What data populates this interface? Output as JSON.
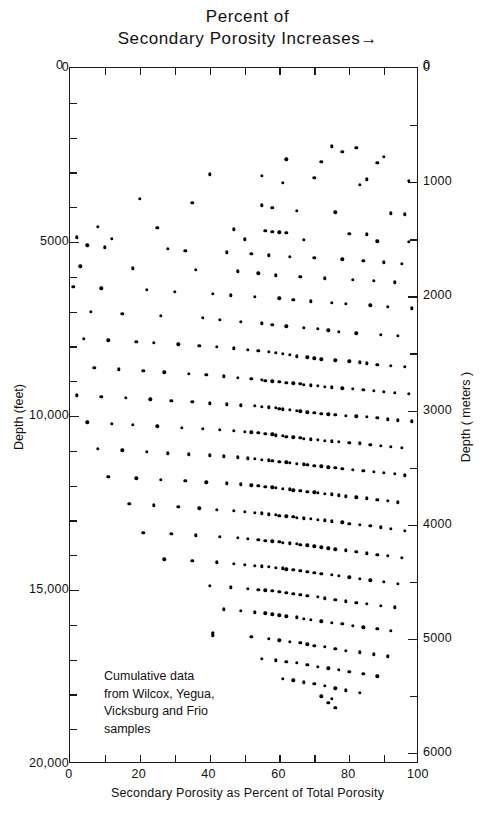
{
  "title": {
    "line1": "Percent of",
    "line2": "Secondary Porosity Increases",
    "arrow": "→"
  },
  "axes": {
    "x": {
      "title": "Secondary Porosity as Percent of Total Porosity",
      "min": 0,
      "max": 100,
      "major_ticks": [
        0,
        20,
        40,
        60,
        80,
        100
      ],
      "minor_ticks": [
        10,
        30,
        50,
        70,
        90
      ],
      "tick_labels": [
        "0",
        "20",
        "40",
        "60",
        "80",
        "100"
      ]
    },
    "y_left": {
      "title": "Depth (feet)",
      "min": 0,
      "max": 20000,
      "major_ticks": [
        0,
        5000,
        10000,
        15000,
        20000
      ],
      "minor_step": 1000,
      "tick_labels": [
        "0",
        "5000",
        "10,000",
        "15,000",
        "20,000"
      ]
    },
    "y_right": {
      "title": "Depth ( meters )",
      "min": 0,
      "max": 6096,
      "major_ticks": [
        0,
        1000,
        2000,
        3000,
        4000,
        5000,
        6000
      ],
      "minor_step": 500,
      "tick_labels": [
        "0",
        "1000",
        "2000",
        "3000",
        "4000",
        "5000",
        "6000"
      ]
    },
    "corner_top_left": "0",
    "corner_top_right": "0"
  },
  "annotation": {
    "lines": [
      "Cumulative data",
      "from Wilcox, Yegua,",
      "Vicksburg and Frio",
      "samples"
    ]
  },
  "chart_data": {
    "type": "scatter",
    "title": "Percent of Secondary Porosity Increases",
    "xlabel": "Secondary Porosity as Percent of Total Porosity",
    "ylabel": "Depth (feet)",
    "ylabel_secondary": "Depth ( meters )",
    "xlim": [
      0,
      100
    ],
    "ylim": [
      20000,
      0
    ],
    "ylim_secondary": [
      6096,
      0
    ],
    "y_inverted": true,
    "grid": false,
    "legend": null,
    "marker": "filled-circle",
    "marker_color": "#000000",
    "marker_size_px": 3.4,
    "n_points": 497,
    "annotation": "Cumulative data from Wilcox, Yegua, Vicksburg and Frio samples",
    "points": [
      [
        75,
        2250
      ],
      [
        82,
        2300
      ],
      [
        78,
        2400
      ],
      [
        90,
        2550
      ],
      [
        62,
        2620
      ],
      [
        72,
        2700
      ],
      [
        88,
        2720
      ],
      [
        40,
        3050
      ],
      [
        55,
        3100
      ],
      [
        70,
        3150
      ],
      [
        85,
        3200
      ],
      [
        97,
        3250
      ],
      [
        61,
        3300
      ],
      [
        83,
        3350
      ],
      [
        20,
        3750
      ],
      [
        35,
        3880
      ],
      [
        55,
        3950
      ],
      [
        58,
        4020
      ],
      [
        65,
        4100
      ],
      [
        76,
        4150
      ],
      [
        92,
        4180
      ],
      [
        96,
        4200
      ],
      [
        8,
        4560
      ],
      [
        25,
        4600
      ],
      [
        47,
        4640
      ],
      [
        56,
        4680
      ],
      [
        58,
        4700
      ],
      [
        60,
        4720
      ],
      [
        62,
        4740
      ],
      [
        80,
        4760
      ],
      [
        85,
        4780
      ],
      [
        2,
        4860
      ],
      [
        12,
        4900
      ],
      [
        50,
        4920
      ],
      [
        67,
        4940
      ],
      [
        88,
        4980
      ],
      [
        97,
        5000
      ],
      [
        5,
        5100
      ],
      [
        10,
        5150
      ],
      [
        28,
        5200
      ],
      [
        33,
        5260
      ],
      [
        45,
        5300
      ],
      [
        52,
        5340
      ],
      [
        57,
        5380
      ],
      [
        63,
        5420
      ],
      [
        70,
        5460
      ],
      [
        78,
        5500
      ],
      [
        84,
        5540
      ],
      [
        90,
        5580
      ],
      [
        95,
        5620
      ],
      [
        3,
        5700
      ],
      [
        18,
        5760
      ],
      [
        36,
        5800
      ],
      [
        48,
        5840
      ],
      [
        54,
        5900
      ],
      [
        59,
        5960
      ],
      [
        66,
        6000
      ],
      [
        73,
        6040
      ],
      [
        81,
        6080
      ],
      [
        87,
        6120
      ],
      [
        93,
        6160
      ],
      [
        1,
        6280
      ],
      [
        9,
        6330
      ],
      [
        22,
        6380
      ],
      [
        30,
        6430
      ],
      [
        41,
        6480
      ],
      [
        46,
        6530
      ],
      [
        53,
        6580
      ],
      [
        60,
        6620
      ],
      [
        64,
        6660
      ],
      [
        69,
        6700
      ],
      [
        75,
        6740
      ],
      [
        79,
        6780
      ],
      [
        86,
        6820
      ],
      [
        91,
        6860
      ],
      [
        98,
        6900
      ],
      [
        6,
        7000
      ],
      [
        15,
        7060
      ],
      [
        26,
        7120
      ],
      [
        38,
        7180
      ],
      [
        43,
        7240
      ],
      [
        49,
        7300
      ],
      [
        55,
        7340
      ],
      [
        58,
        7380
      ],
      [
        62,
        7420
      ],
      [
        67,
        7460
      ],
      [
        71,
        7500
      ],
      [
        74,
        7540
      ],
      [
        77,
        7580
      ],
      [
        82,
        7620
      ],
      [
        89,
        7660
      ],
      [
        94,
        7700
      ],
      [
        4,
        7780
      ],
      [
        11,
        7820
      ],
      [
        19,
        7860
      ],
      [
        24,
        7900
      ],
      [
        31,
        7940
      ],
      [
        37,
        7980
      ],
      [
        42,
        8020
      ],
      [
        47,
        8060
      ],
      [
        51,
        8100
      ],
      [
        54,
        8130
      ],
      [
        57,
        8160
      ],
      [
        59,
        8190
      ],
      [
        61,
        8220
      ],
      [
        63,
        8250
      ],
      [
        65,
        8280
      ],
      [
        68,
        8310
      ],
      [
        70,
        8340
      ],
      [
        72,
        8370
      ],
      [
        76,
        8400
      ],
      [
        80,
        8430
      ],
      [
        83,
        8460
      ],
      [
        85,
        8490
      ],
      [
        88,
        8520
      ],
      [
        92,
        8550
      ],
      [
        96,
        8580
      ],
      [
        7,
        8620
      ],
      [
        14,
        8660
      ],
      [
        21,
        8700
      ],
      [
        27,
        8740
      ],
      [
        34,
        8780
      ],
      [
        39,
        8820
      ],
      [
        44,
        8860
      ],
      [
        48,
        8900
      ],
      [
        52,
        8930
      ],
      [
        55,
        8960
      ],
      [
        56,
        8980
      ],
      [
        58,
        9000
      ],
      [
        60,
        9020
      ],
      [
        62,
        9040
      ],
      [
        64,
        9060
      ],
      [
        66,
        9080
      ],
      [
        67,
        9100
      ],
      [
        69,
        9120
      ],
      [
        71,
        9140
      ],
      [
        73,
        9160
      ],
      [
        75,
        9180
      ],
      [
        78,
        9200
      ],
      [
        81,
        9220
      ],
      [
        84,
        9250
      ],
      [
        87,
        9280
      ],
      [
        90,
        9310
      ],
      [
        93,
        9340
      ],
      [
        97,
        9370
      ],
      [
        2,
        9400
      ],
      [
        9,
        9440
      ],
      [
        16,
        9480
      ],
      [
        23,
        9520
      ],
      [
        29,
        9560
      ],
      [
        35,
        9600
      ],
      [
        40,
        9630
      ],
      [
        45,
        9660
      ],
      [
        49,
        9690
      ],
      [
        53,
        9710
      ],
      [
        55,
        9730
      ],
      [
        57,
        9750
      ],
      [
        59,
        9770
      ],
      [
        60,
        9790
      ],
      [
        61,
        9810
      ],
      [
        63,
        9830
      ],
      [
        65,
        9850
      ],
      [
        66,
        9870
      ],
      [
        68,
        9890
      ],
      [
        70,
        9910
      ],
      [
        72,
        9930
      ],
      [
        74,
        9950
      ],
      [
        76,
        9970
      ],
      [
        79,
        9990
      ],
      [
        82,
        10010
      ],
      [
        85,
        10030
      ],
      [
        88,
        10060
      ],
      [
        91,
        10090
      ],
      [
        94,
        10120
      ],
      [
        98,
        10150
      ],
      [
        5,
        10180
      ],
      [
        12,
        10220
      ],
      [
        18,
        10260
      ],
      [
        25,
        10300
      ],
      [
        32,
        10340
      ],
      [
        38,
        10370
      ],
      [
        43,
        10400
      ],
      [
        47,
        10430
      ],
      [
        50,
        10450
      ],
      [
        52,
        10470
      ],
      [
        54,
        10490
      ],
      [
        56,
        10510
      ],
      [
        58,
        10530
      ],
      [
        59,
        10550
      ],
      [
        61,
        10570
      ],
      [
        62,
        10590
      ],
      [
        64,
        10610
      ],
      [
        66,
        10630
      ],
      [
        67,
        10650
      ],
      [
        69,
        10670
      ],
      [
        71,
        10690
      ],
      [
        73,
        10710
      ],
      [
        75,
        10730
      ],
      [
        77,
        10750
      ],
      [
        80,
        10770
      ],
      [
        83,
        10790
      ],
      [
        86,
        10820
      ],
      [
        89,
        10850
      ],
      [
        92,
        10880
      ],
      [
        95,
        10910
      ],
      [
        8,
        10950
      ],
      [
        15,
        10990
      ],
      [
        22,
        11030
      ],
      [
        28,
        11070
      ],
      [
        34,
        11100
      ],
      [
        40,
        11130
      ],
      [
        44,
        11160
      ],
      [
        48,
        11190
      ],
      [
        51,
        11210
      ],
      [
        53,
        11230
      ],
      [
        55,
        11250
      ],
      [
        57,
        11270
      ],
      [
        58,
        11290
      ],
      [
        60,
        11310
      ],
      [
        62,
        11330
      ],
      [
        63,
        11350
      ],
      [
        65,
        11370
      ],
      [
        67,
        11390
      ],
      [
        68,
        11410
      ],
      [
        70,
        11430
      ],
      [
        72,
        11450
      ],
      [
        74,
        11470
      ],
      [
        76,
        11490
      ],
      [
        78,
        11510
      ],
      [
        81,
        11540
      ],
      [
        84,
        11570
      ],
      [
        87,
        11600
      ],
      [
        90,
        11630
      ],
      [
        93,
        11660
      ],
      [
        96,
        11700
      ],
      [
        11,
        11750
      ],
      [
        19,
        11790
      ],
      [
        26,
        11830
      ],
      [
        33,
        11870
      ],
      [
        39,
        11900
      ],
      [
        45,
        11930
      ],
      [
        49,
        11960
      ],
      [
        52,
        11990
      ],
      [
        54,
        12010
      ],
      [
        56,
        12030
      ],
      [
        58,
        12050
      ],
      [
        59,
        12070
      ],
      [
        61,
        12090
      ],
      [
        63,
        12110
      ],
      [
        64,
        12130
      ],
      [
        66,
        12150
      ],
      [
        68,
        12170
      ],
      [
        70,
        12190
      ],
      [
        71,
        12210
      ],
      [
        73,
        12230
      ],
      [
        75,
        12250
      ],
      [
        77,
        12280
      ],
      [
        79,
        12310
      ],
      [
        82,
        12340
      ],
      [
        85,
        12370
      ],
      [
        88,
        12400
      ],
      [
        91,
        12440
      ],
      [
        94,
        12480
      ],
      [
        17,
        12530
      ],
      [
        24,
        12570
      ],
      [
        31,
        12610
      ],
      [
        37,
        12650
      ],
      [
        42,
        12690
      ],
      [
        47,
        12720
      ],
      [
        50,
        12750
      ],
      [
        53,
        12780
      ],
      [
        55,
        12800
      ],
      [
        57,
        12820
      ],
      [
        59,
        12840
      ],
      [
        60,
        12860
      ],
      [
        62,
        12880
      ],
      [
        64,
        12900
      ],
      [
        65,
        12920
      ],
      [
        67,
        12940
      ],
      [
        69,
        12960
      ],
      [
        71,
        12980
      ],
      [
        73,
        13000
      ],
      [
        75,
        13030
      ],
      [
        78,
        13060
      ],
      [
        80,
        13090
      ],
      [
        83,
        13120
      ],
      [
        86,
        13160
      ],
      [
        89,
        13200
      ],
      [
        92,
        13250
      ],
      [
        96,
        13300
      ],
      [
        21,
        13350
      ],
      [
        29,
        13390
      ],
      [
        36,
        13430
      ],
      [
        43,
        13470
      ],
      [
        48,
        13500
      ],
      [
        51,
        13530
      ],
      [
        54,
        13560
      ],
      [
        56,
        13580
      ],
      [
        58,
        13600
      ],
      [
        60,
        13620
      ],
      [
        61,
        13640
      ],
      [
        63,
        13660
      ],
      [
        65,
        13680
      ],
      [
        66,
        13700
      ],
      [
        68,
        13720
      ],
      [
        70,
        13740
      ],
      [
        72,
        13770
      ],
      [
        74,
        13800
      ],
      [
        76,
        13830
      ],
      [
        79,
        13860
      ],
      [
        82,
        13900
      ],
      [
        85,
        13940
      ],
      [
        88,
        13980
      ],
      [
        91,
        14020
      ],
      [
        95,
        14070
      ],
      [
        27,
        14120
      ],
      [
        35,
        14160
      ],
      [
        42,
        14200
      ],
      [
        47,
        14240
      ],
      [
        50,
        14270
      ],
      [
        53,
        14300
      ],
      [
        55,
        14320
      ],
      [
        57,
        14340
      ],
      [
        59,
        14360
      ],
      [
        61,
        14380
      ],
      [
        62,
        14400
      ],
      [
        64,
        14420
      ],
      [
        66,
        14450
      ],
      [
        68,
        14480
      ],
      [
        70,
        14510
      ],
      [
        72,
        14540
      ],
      [
        75,
        14570
      ],
      [
        77,
        14600
      ],
      [
        80,
        14640
      ],
      [
        83,
        14680
      ],
      [
        86,
        14720
      ],
      [
        90,
        14770
      ],
      [
        94,
        14820
      ],
      [
        40,
        14880
      ],
      [
        46,
        14920
      ],
      [
        51,
        14960
      ],
      [
        54,
        14990
      ],
      [
        56,
        15010
      ],
      [
        58,
        15030
      ],
      [
        60,
        15050
      ],
      [
        62,
        15080
      ],
      [
        64,
        15110
      ],
      [
        66,
        15140
      ],
      [
        68,
        15170
      ],
      [
        71,
        15200
      ],
      [
        73,
        15240
      ],
      [
        76,
        15280
      ],
      [
        79,
        15320
      ],
      [
        82,
        15360
      ],
      [
        85,
        15400
      ],
      [
        89,
        15450
      ],
      [
        93,
        15500
      ],
      [
        44,
        15560
      ],
      [
        49,
        15600
      ],
      [
        53,
        15640
      ],
      [
        56,
        15670
      ],
      [
        58,
        15700
      ],
      [
        60,
        15730
      ],
      [
        62,
        15760
      ],
      [
        65,
        15790
      ],
      [
        67,
        15820
      ],
      [
        69,
        15860
      ],
      [
        72,
        15900
      ],
      [
        75,
        15940
      ],
      [
        78,
        15980
      ],
      [
        81,
        16020
      ],
      [
        84,
        16070
      ],
      [
        88,
        16120
      ],
      [
        92,
        16180
      ],
      [
        41,
        16240
      ],
      [
        41,
        16300
      ],
      [
        52,
        16350
      ],
      [
        57,
        16400
      ],
      [
        60,
        16440
      ],
      [
        63,
        16480
      ],
      [
        66,
        16520
      ],
      [
        68,
        16560
      ],
      [
        70,
        16600
      ],
      [
        73,
        16640
      ],
      [
        76,
        16690
      ],
      [
        79,
        16740
      ],
      [
        83,
        16790
      ],
      [
        87,
        16850
      ],
      [
        91,
        16910
      ],
      [
        55,
        16980
      ],
      [
        59,
        17020
      ],
      [
        62,
        17060
      ],
      [
        65,
        17100
      ],
      [
        68,
        17150
      ],
      [
        71,
        17200
      ],
      [
        74,
        17250
      ],
      [
        77,
        17300
      ],
      [
        80,
        17350
      ],
      [
        84,
        17410
      ],
      [
        88,
        17480
      ],
      [
        61,
        17550
      ],
      [
        64,
        17600
      ],
      [
        67,
        17650
      ],
      [
        70,
        17700
      ],
      [
        73,
        17760
      ],
      [
        76,
        17820
      ],
      [
        79,
        17880
      ],
      [
        83,
        17950
      ],
      [
        72,
        18050
      ],
      [
        75,
        18120
      ],
      [
        74,
        18250
      ],
      [
        76,
        18380
      ]
    ]
  }
}
